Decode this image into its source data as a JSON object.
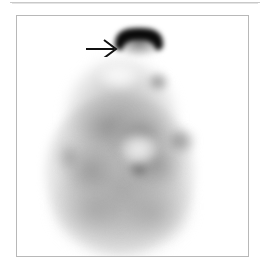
{
  "figure": {
    "modality": "planar scintigraphy",
    "view": "anterior head and neck",
    "background_color": "#ffffff",
    "frame_color": "#b8b8b8",
    "top_rule_color": "#c9c9c9",
    "caption": "",
    "scan": {
      "name": "scintigram",
      "alt_text": "Grayscale planar scintigraphy image of the head and neck showing diffuse low-grade background uptake with an intense focal area of tracer accumulation at the superior aspect.",
      "tracer_scale": "inverted grayscale: dark equals high uptake"
    },
    "annotations": [
      {
        "name": "hot-spot",
        "type": "focal-uptake",
        "label": "",
        "color": "#000000",
        "shape": "crescent",
        "x": 112,
        "y": 28,
        "width": 54,
        "height": 30,
        "description": "intense focal tracer uptake"
      },
      {
        "name": "pointer-arrow",
        "type": "arrow",
        "label": "",
        "color": "#000000",
        "direction": "right",
        "x": 84,
        "y": 36,
        "width": 34,
        "height": 20,
        "description": "arrow indicating the focal hot spot"
      }
    ],
    "regions": [
      {
        "name": "body-silhouette",
        "intensity": "low",
        "description": "diffuse soft tissue background activity"
      },
      {
        "name": "central-photopenic-area",
        "intensity": "none",
        "description": "relatively cold central region"
      },
      {
        "name": "right-lateral-focus",
        "intensity": "moderate",
        "description": "mild focal activity right lateral"
      },
      {
        "name": "central-focus",
        "intensity": "moderate",
        "description": "mild focal activity midline"
      }
    ]
  }
}
